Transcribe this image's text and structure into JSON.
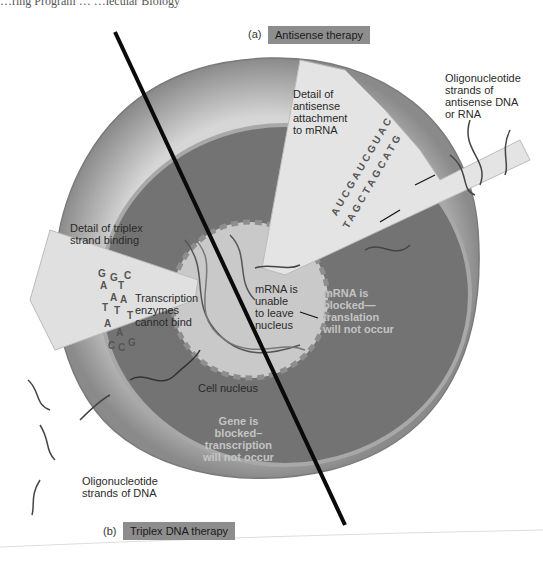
{
  "header": {
    "running_title": "…ring Program … …lecular Biology"
  },
  "panels": {
    "a": {
      "letter": "(a)",
      "title": "Antisense therapy"
    },
    "b": {
      "letter": "(b)",
      "title": "Triplex DNA therapy"
    }
  },
  "labels": {
    "antisense_detail": [
      "Detail of",
      "antisense",
      "attachment",
      "to mRNA"
    ],
    "oligo_antisense": [
      "Oligonucleotide",
      "strands of",
      "antisense DNA",
      "or RNA"
    ],
    "triplex_detail": [
      "Detail of triplex",
      "strand binding"
    ],
    "transcription_enzymes": [
      "Transcription",
      "enzymes",
      "cannot bind"
    ],
    "mrna_unable": [
      "mRNA is",
      "unable",
      "to leave",
      "nucleus"
    ],
    "mrna_blocked": [
      "mRNA is",
      "blocked—",
      "translation",
      "will not occur"
    ],
    "cell_nucleus": "Cell nucleus",
    "gene_blocked": [
      "Gene is",
      "blocked–",
      "transcription",
      "will not occur"
    ],
    "oligo_dna": [
      "Oligonucleotide",
      "strands of DNA"
    ]
  },
  "sequences": {
    "antisense_top": "AUCGAUCGUAC",
    "antisense_bottom": "TAGCTAGCATG",
    "triplex_bases": [
      "G",
      "A",
      "G",
      "T",
      "C",
      "A",
      "A",
      "T",
      "T",
      "T",
      "A",
      "A",
      "C",
      "C",
      "G"
    ]
  },
  "colors": {
    "cytoplasm_outer": "#9a9a9a",
    "cytoplasm_inner": "#6e6e6e",
    "nucleus": "#c8c8c8",
    "wedge": "#dcdcdc",
    "tag_bg": "#8d8d8d"
  }
}
